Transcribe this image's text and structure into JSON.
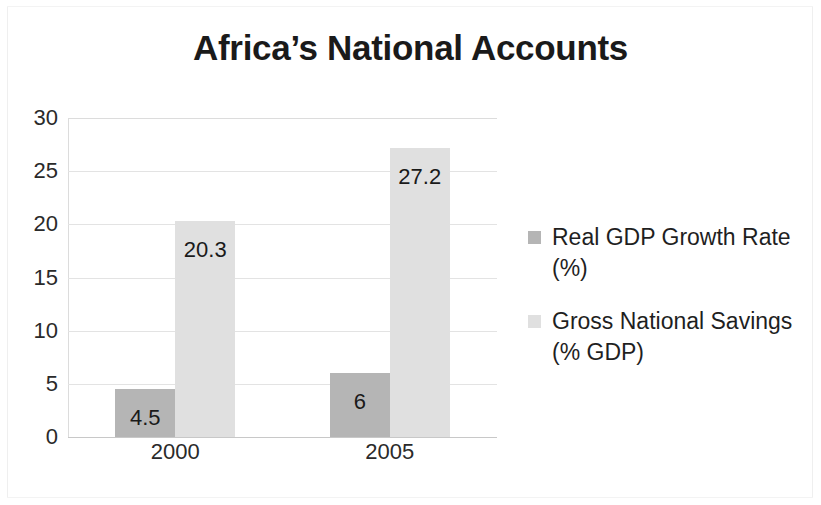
{
  "chart_data": {
    "type": "bar",
    "title": "Africa’s National Accounts",
    "xlabel": "",
    "ylabel": "",
    "categories": [
      "2000",
      "2005"
    ],
    "series": [
      {
        "name": "Real GDP Growth Rate (%)",
        "name_lines": [
          "Real GDP Growth Rate",
          "(%)"
        ],
        "color": "#b5b5b5",
        "values": [
          4.5,
          6
        ],
        "labels": [
          "4.5",
          "6"
        ]
      },
      {
        "name": "Gross National Savings (% GDP)",
        "name_lines": [
          "Gross National Savings",
          "(% GDP)"
        ],
        "color": "#e0e0e0",
        "values": [
          20.3,
          27.2
        ],
        "labels": [
          "20.3",
          "27.2"
        ]
      }
    ],
    "ylim": [
      0,
      30
    ],
    "ytick_step": 5,
    "yticks": [
      "0",
      "5",
      "10",
      "15",
      "20",
      "25",
      "30"
    ],
    "ytick_values": [
      0,
      5,
      10,
      15,
      20,
      25,
      30
    ],
    "grid": true,
    "legend_position": "right",
    "background_color": "#ffffff",
    "gridline_color": "#e3e3e3",
    "axis_color": "#c8c8c8",
    "text_color": "#1a1a1a"
  }
}
